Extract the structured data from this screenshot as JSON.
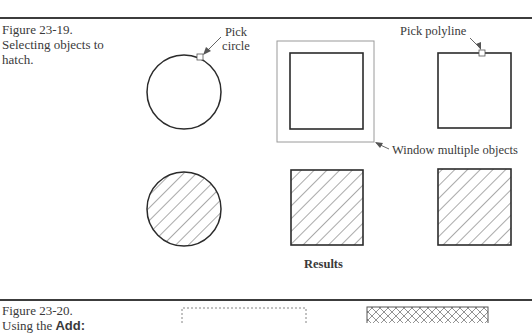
{
  "figure_23_19": {
    "number": "Figure 23-19.",
    "caption_line1": "Selecting objects to",
    "caption_line2": "hatch.",
    "callouts": {
      "pick_circle_line1": "Pick",
      "pick_circle_line2": "circle",
      "pick_polyline": "Pick polyline",
      "window_multiple": "Window multiple objects"
    },
    "results_label": "Results",
    "objects": [
      {
        "name": "circle",
        "selection": "pick",
        "result": "hatched"
      },
      {
        "name": "square-in-window",
        "selection": "window",
        "result": "hatched"
      },
      {
        "name": "polyline-square",
        "selection": "pick",
        "result": "hatched"
      }
    ]
  },
  "figure_23_20": {
    "number": "Figure 23-20.",
    "caption_partial_prefix": "Using the ",
    "caption_partial_bold": "Add:"
  },
  "colors": {
    "rule": "#3c3c3c",
    "stroke": "#2b2b2b",
    "window_stroke": "#9a9a9a",
    "hatch": "#555555",
    "text": "#3a3a3a"
  }
}
